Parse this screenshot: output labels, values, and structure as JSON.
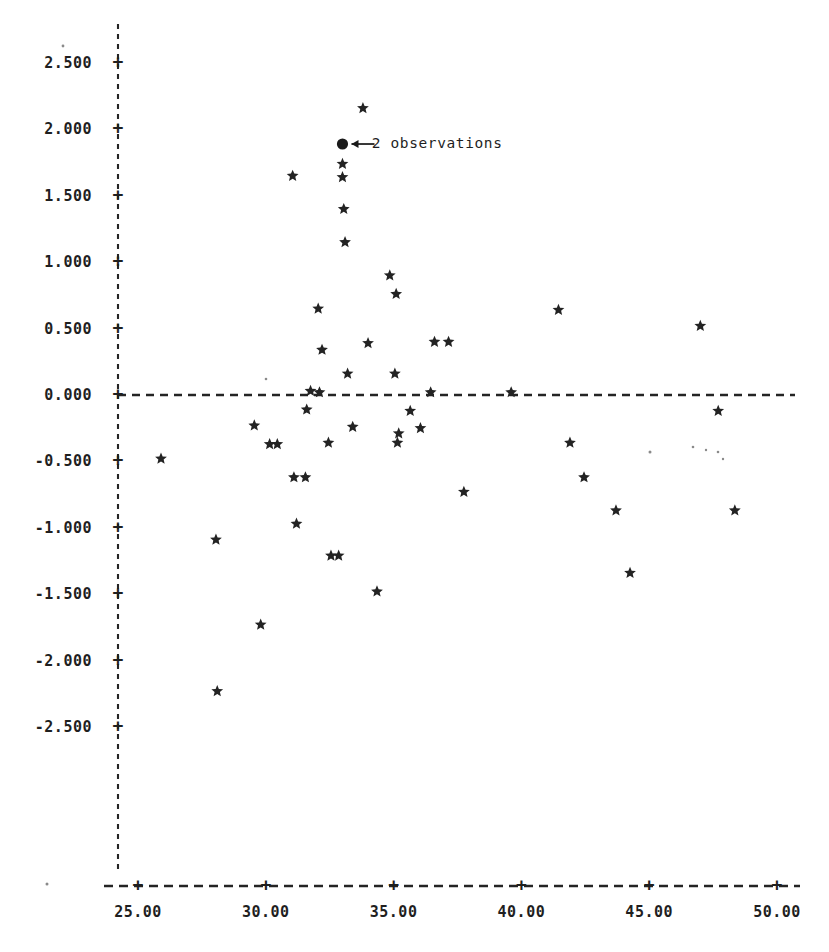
{
  "chart_data": {
    "type": "scatter",
    "title": "",
    "subtitle": "",
    "xlabel": "",
    "ylabel": "",
    "xlim": [
      24.0,
      51.2
    ],
    "ylim": [
      -3.05,
      2.85
    ],
    "grid": false,
    "legend": null,
    "marker": "star",
    "reference_lines": [
      {
        "orientation": "horizontal",
        "value": 0.0,
        "style": "dashed"
      }
    ],
    "xticks": [
      25.0,
      30.0,
      35.0,
      40.0,
      45.0,
      50.0
    ],
    "xtick_labels": [
      "25.00",
      "30.00",
      "35.00",
      "40.00",
      "45.00",
      "50.00"
    ],
    "yticks": [
      2.5,
      2.0,
      1.5,
      1.0,
      0.5,
      0.0,
      -0.5,
      -1.0,
      -1.5,
      -2.0,
      -2.5
    ],
    "ytick_labels": [
      "2.500",
      "2.000",
      "1.500",
      "1.000",
      "0.500",
      "0.000",
      "-0.500",
      "-1.000",
      "-1.500",
      "-2.000",
      "-2.500"
    ],
    "annotations": [
      {
        "text": "2 observations",
        "x": 33.0,
        "y": 1.89,
        "marker": "filled-circle",
        "arrow": "left",
        "text_x": 34.15
      }
    ],
    "points": [
      {
        "x": 25.9,
        "y": -0.48
      },
      {
        "x": 28.05,
        "y": -1.09
      },
      {
        "x": 28.1,
        "y": -2.23
      },
      {
        "x": 29.55,
        "y": -0.23
      },
      {
        "x": 29.8,
        "y": -1.73
      },
      {
        "x": 30.15,
        "y": -0.37
      },
      {
        "x": 30.45,
        "y": -0.37
      },
      {
        "x": 31.05,
        "y": 1.65
      },
      {
        "x": 31.1,
        "y": -0.62
      },
      {
        "x": 31.2,
        "y": -0.97
      },
      {
        "x": 31.55,
        "y": -0.62
      },
      {
        "x": 31.6,
        "y": -0.11
      },
      {
        "x": 31.75,
        "y": 0.03
      },
      {
        "x": 32.05,
        "y": 0.65
      },
      {
        "x": 32.1,
        "y": 0.02
      },
      {
        "x": 32.2,
        "y": 0.34
      },
      {
        "x": 32.45,
        "y": -0.36
      },
      {
        "x": 32.55,
        "y": -1.21
      },
      {
        "x": 32.85,
        "y": -1.21
      },
      {
        "x": 33.0,
        "y": 1.74
      },
      {
        "x": 33.0,
        "y": 1.64
      },
      {
        "x": 33.05,
        "y": 1.4
      },
      {
        "x": 33.1,
        "y": 1.15
      },
      {
        "x": 33.2,
        "y": 0.16
      },
      {
        "x": 33.4,
        "y": -0.24
      },
      {
        "x": 33.8,
        "y": 2.16
      },
      {
        "x": 34.0,
        "y": 0.39
      },
      {
        "x": 34.35,
        "y": -1.48
      },
      {
        "x": 34.85,
        "y": 0.9
      },
      {
        "x": 35.05,
        "y": 0.16
      },
      {
        "x": 35.1,
        "y": 0.76
      },
      {
        "x": 35.15,
        "y": -0.36
      },
      {
        "x": 35.2,
        "y": -0.29
      },
      {
        "x": 35.65,
        "y": -0.12
      },
      {
        "x": 36.05,
        "y": -0.25
      },
      {
        "x": 36.45,
        "y": 0.02
      },
      {
        "x": 36.6,
        "y": 0.4
      },
      {
        "x": 37.15,
        "y": 0.4
      },
      {
        "x": 37.75,
        "y": -0.73
      },
      {
        "x": 39.6,
        "y": 0.02
      },
      {
        "x": 41.45,
        "y": 0.64
      },
      {
        "x": 41.9,
        "y": -0.36
      },
      {
        "x": 42.45,
        "y": -0.62
      },
      {
        "x": 43.7,
        "y": -0.87
      },
      {
        "x": 44.25,
        "y": -1.34
      },
      {
        "x": 47.0,
        "y": 0.52
      },
      {
        "x": 47.7,
        "y": -0.12
      },
      {
        "x": 48.35,
        "y": -0.87
      }
    ],
    "point_count": 49
  },
  "axes": {
    "y_axis_style": "dashed-vertical",
    "x_axis_style": "dashed-horizontal",
    "tick_glyph": "+"
  }
}
